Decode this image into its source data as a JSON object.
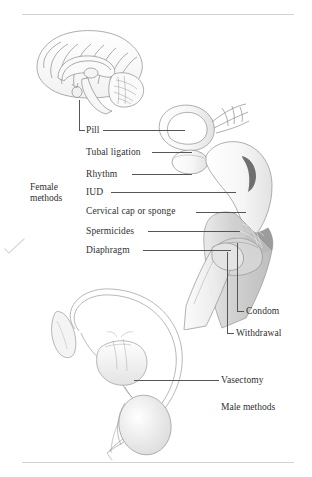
{
  "figure": {
    "background_color": "#ffffff",
    "line_color": "#555555",
    "text_color": "#2f2f2f"
  },
  "groups": {
    "female": "Female\nmethods",
    "female_line1": "Female",
    "female_line2": "methods",
    "male": "Male methods"
  },
  "female_labels": [
    {
      "text": "Pill",
      "top": 125
    },
    {
      "text": "Tubal ligation",
      "top": 148
    },
    {
      "text": "Rhythm",
      "top": 170
    },
    {
      "text": "IUD",
      "top": 188
    },
    {
      "text": "Cervical cap or sponge",
      "top": 207
    },
    {
      "text": "Spermicides",
      "top": 227
    },
    {
      "text": "Diaphragm",
      "top": 246
    }
  ],
  "male_labels": [
    {
      "text": "Condom",
      "top": 308
    },
    {
      "text": "Withdrawal",
      "top": 330
    },
    {
      "text": "Vasectomy",
      "top": 376
    }
  ],
  "anatomy": {
    "brain": "midsagittal-brain-illustration",
    "female_tract": "uterus-fallopian-tube-ovary-vagina-illustration",
    "male_tract": "prostate-vas-deferens-testis-illustration"
  },
  "artifacts": {
    "scan_mark": "checkmark-scan-artifact"
  }
}
